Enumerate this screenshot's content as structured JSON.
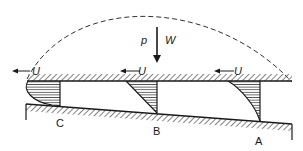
{
  "diagram": {
    "title": "",
    "type": "slider bearing velocity profile",
    "load": {
      "arrow_label": "W",
      "pressure_label": "p"
    },
    "velocity_labels": [
      "U",
      "U",
      "U"
    ],
    "sections": [
      {
        "label": "C",
        "profile": "reversed curved (backflow)"
      },
      {
        "label": "B",
        "profile": "linear (Couette)"
      },
      {
        "label": "A",
        "profile": "convex curved"
      }
    ],
    "pressure_curve": "dashed parabolic arc",
    "colors": {
      "ink": "#1a1a1a",
      "background": "#ffffff"
    }
  }
}
